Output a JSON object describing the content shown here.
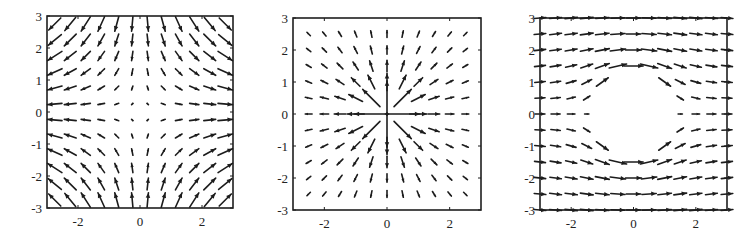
{
  "figure": {
    "panels": 3,
    "background": "#ffffff",
    "ink_color": "#1c1c1c"
  },
  "chart_data": [
    {
      "type": "quiver",
      "title": "",
      "description": "Saddle vector field",
      "field": "saddle",
      "formula": "(x, -y)",
      "xlim": [
        -3,
        3
      ],
      "ylim": [
        -3,
        3
      ],
      "xticks": [
        -2,
        0,
        2
      ],
      "yticks": [
        3,
        2,
        1,
        0,
        -1,
        -2,
        -3
      ],
      "xtick_labels": [
        "-2",
        "0",
        "2"
      ],
      "ytick_labels": [
        "3",
        "2",
        "1",
        "0",
        "-1",
        "-2",
        "-3"
      ],
      "grid_points": {
        "start": -2.75,
        "step": 0.5,
        "count": 12
      },
      "grid": false,
      "box_px": {
        "left": 47,
        "top": 16,
        "right": 233,
        "bottom": 208
      }
    },
    {
      "type": "quiver",
      "title": "",
      "description": "Point source vector field (radial outward, magnitude ~ 1/r)",
      "field": "source",
      "formula": "(x, y) / r^2",
      "xlim": [
        -3,
        3
      ],
      "ylim": [
        -3,
        3
      ],
      "xticks": [
        -2,
        0,
        2
      ],
      "yticks": [
        3,
        2,
        1,
        0,
        -1,
        -2,
        -3
      ],
      "xtick_labels": [
        "-2",
        "0",
        "2"
      ],
      "ytick_labels": [
        "3",
        "2",
        "1",
        "0",
        "-1",
        "-2",
        "-3"
      ],
      "grid_points": {
        "start": -2.5,
        "step": 0.5,
        "count": 11
      },
      "grid": false,
      "box_px": {
        "left": 293,
        "top": 18,
        "right": 481,
        "bottom": 210
      }
    },
    {
      "type": "quiver",
      "title": "",
      "description": "Uniform flow past a cylinder of radius ~1 (potential flow), vectors inside cylinder omitted",
      "field": "cylinder",
      "formula": "U(1 - a^2(x^2-y^2)/r^4, -2a^2xy/r^4), a = 1.2",
      "xlim": [
        -3,
        3
      ],
      "ylim": [
        -3,
        3
      ],
      "xticks": [
        -2,
        0,
        2
      ],
      "yticks": [
        3,
        2,
        1,
        0,
        -1,
        -2,
        -3
      ],
      "xtick_labels": [
        "-2",
        "0",
        "2"
      ],
      "ytick_labels": [
        "3",
        "2",
        "1",
        "0",
        "-1",
        "-2",
        "-3"
      ],
      "grid_points": {
        "start": -3,
        "step": 0.5,
        "count": 13
      },
      "cylinder_radius": 1.2,
      "grid": false,
      "box_px": {
        "left": 540,
        "top": 18,
        "right": 727,
        "bottom": 210
      }
    }
  ]
}
